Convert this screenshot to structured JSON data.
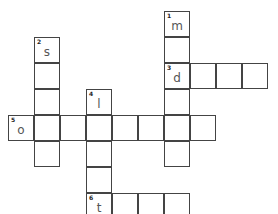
{
  "puzzle": {
    "cell_size": 26,
    "origin": {
      "x": 8,
      "y": 11
    },
    "words": [
      {
        "number": "1",
        "direction": "down",
        "row": 0,
        "col": 6,
        "length": 6,
        "letters": [
          "m",
          "",
          "",
          "",
          "",
          ""
        ]
      },
      {
        "number": "2",
        "direction": "down",
        "row": 1,
        "col": 1,
        "length": 5,
        "letters": [
          "s",
          "",
          "",
          "",
          ""
        ]
      },
      {
        "number": "3",
        "direction": "across",
        "row": 2,
        "col": 6,
        "length": 4,
        "letters": [
          "d",
          "",
          "",
          ""
        ]
      },
      {
        "number": "4",
        "direction": "down",
        "row": 3,
        "col": 3,
        "length": 6,
        "letters": [
          "l",
          "",
          "",
          "",
          "",
          ""
        ]
      },
      {
        "number": "5",
        "direction": "across",
        "row": 4,
        "col": 0,
        "length": 8,
        "letters": [
          "o",
          "",
          "",
          "",
          "",
          "",
          "",
          ""
        ]
      },
      {
        "number": "6",
        "direction": "across",
        "row": 7,
        "col": 3,
        "length": 4,
        "letters": [
          "t",
          "",
          "",
          ""
        ]
      }
    ]
  }
}
